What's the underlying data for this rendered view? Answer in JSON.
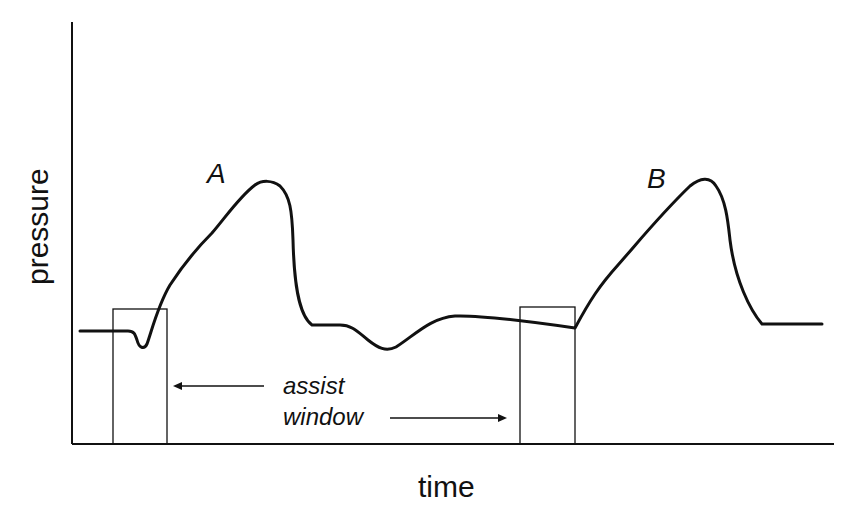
{
  "diagram": {
    "ylabel": "pressure",
    "xlabel": "time",
    "curve_labels": {
      "a": "A",
      "b": "B"
    },
    "annotation": {
      "line1": "assist",
      "line2": "window"
    },
    "stroke_color": "#111111",
    "background": "#ffffff"
  }
}
